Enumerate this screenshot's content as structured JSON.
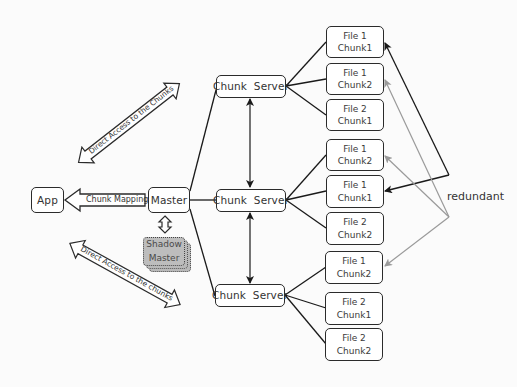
{
  "diagram": {
    "colors": {
      "background": "#fbfbfb",
      "box_border": "#2b2b2b",
      "shadow_fill": "#bdbdbd",
      "primary_link": "#1a1a1a",
      "redundant_link": "#9a9a9a"
    },
    "app": {
      "label": "App"
    },
    "master": {
      "label": "Master"
    },
    "shadow_master": {
      "line1": "Shadow",
      "line2": "Master"
    },
    "chunk_mappings_arrow": {
      "label": "Chunk Mappings"
    },
    "direct_access_upper": {
      "label": "Direct Access to the Chunks"
    },
    "direct_access_lower": {
      "label": "Direct Access to the chunks"
    },
    "chunk_servers": [
      {
        "label": "Chunk  Server"
      },
      {
        "label": "Chunk  Server"
      },
      {
        "label": "Chunk  Server"
      }
    ],
    "chunks": [
      {
        "file": "File 1",
        "chunk": "Chunk1"
      },
      {
        "file": "File 1",
        "chunk": "Chunk2"
      },
      {
        "file": "File 2",
        "chunk": "Chunk1"
      },
      {
        "file": "File 1",
        "chunk": "Chunk2"
      },
      {
        "file": "File 1",
        "chunk": "Chunk1"
      },
      {
        "file": "File 2",
        "chunk": "Chunk2"
      },
      {
        "file": "File 1",
        "chunk": "Chunk2"
      },
      {
        "file": "File 2",
        "chunk": "Chunk1"
      },
      {
        "file": "File 2",
        "chunk": "Chunk2"
      }
    ],
    "redundant_label": "redundant"
  }
}
